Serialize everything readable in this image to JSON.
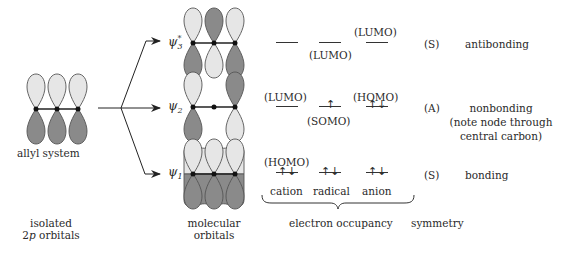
{
  "diagram": {
    "type": "allyl pi molecular orbital diagram",
    "colors": {
      "light_lobe": "#e6e6e6",
      "dark_lobe": "#8a8a8a",
      "outline": "#555555",
      "line": "#222222"
    },
    "left": {
      "label": "allyl  system",
      "caption_line1": "isolated",
      "caption_line2_prefix": "2",
      "caption_line2_italic": "p",
      "caption_line2_suffix": " orbitals"
    },
    "orbitals": [
      {
        "id": "psi3",
        "symbol": "ψ",
        "subscript": "3",
        "superscript": "*",
        "lobes_top": [
          "light",
          "dark",
          "light"
        ],
        "lobes_bottom": [
          "dark",
          "light",
          "dark"
        ],
        "levels": [
          {
            "column": "cation",
            "electrons": "",
            "tag": "",
            "tag_position": ""
          },
          {
            "column": "radical",
            "electrons": "",
            "tag": "(LUMO)",
            "tag_position": "below"
          },
          {
            "column": "anion",
            "electrons": "",
            "tag": "(LUMO)",
            "tag_position": "above"
          }
        ],
        "symmetry": "(S)",
        "description": "antibonding"
      },
      {
        "id": "psi2",
        "symbol": "ψ",
        "subscript": "2",
        "superscript": "",
        "lobes_top": [
          "light",
          "none",
          "dark"
        ],
        "lobes_bottom": [
          "dark",
          "none",
          "light"
        ],
        "levels": [
          {
            "column": "cation",
            "electrons": "",
            "tag": "(LUMO)",
            "tag_position": "above"
          },
          {
            "column": "radical",
            "electrons": "↑",
            "tag": "(SOMO)",
            "tag_position": "below"
          },
          {
            "column": "anion",
            "electrons": "↑↓",
            "tag": "(HOMO)",
            "tag_position": "above"
          }
        ],
        "symmetry": "(A)",
        "description": "nonbonding",
        "note_line1": "(note node through",
        "note_line2": "central carbon)"
      },
      {
        "id": "psi1",
        "symbol": "ψ",
        "subscript": "1",
        "superscript": "",
        "lobes_top": [
          "light",
          "light",
          "light"
        ],
        "lobes_bottom": [
          "dark",
          "dark",
          "dark"
        ],
        "levels": [
          {
            "column": "cation",
            "electrons": "↑↓",
            "tag": "(HOMO)",
            "tag_position": "above"
          },
          {
            "column": "radical",
            "electrons": "↑↓",
            "tag": "",
            "tag_position": ""
          },
          {
            "column": "anion",
            "electrons": "↑↓",
            "tag": "",
            "tag_position": ""
          }
        ],
        "symmetry": "(S)",
        "description": "bonding"
      }
    ],
    "columns": [
      "cation",
      "radical",
      "anion"
    ],
    "captions": {
      "molecular_line1": "molecular",
      "molecular_line2": "orbitals",
      "occupancy": "electron occupancy",
      "symmetry": "symmetry"
    }
  }
}
